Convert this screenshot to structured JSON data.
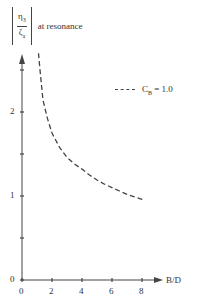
{
  "chart_data": {
    "type": "line",
    "title": "",
    "ylabel": "|η3 / ζa| at resonance",
    "ylabel_parts": {
      "numerator": "η",
      "numerator_sub": "3",
      "denominator": "ζ",
      "denominator_sub": "a",
      "suffix": "at resonance"
    },
    "xlabel": "B/D",
    "xlim": [
      0,
      8.8
    ],
    "ylim": [
      0,
      2.8
    ],
    "x_ticks": [
      0,
      2,
      4,
      6,
      8
    ],
    "x_tick_labels": [
      "0",
      "2",
      "4",
      "6",
      "8"
    ],
    "y_ticks": [
      0,
      0.5,
      1,
      1.5,
      2,
      2.5
    ],
    "y_tick_labels": [
      "0",
      "",
      "1",
      "",
      "2",
      ""
    ],
    "grid": false,
    "legend_position": "upper right",
    "series": [
      {
        "name": "C_B = 1.0",
        "legend_label": "C",
        "legend_sub": "B",
        "legend_value": "= 1.0",
        "style": "dashed",
        "x": [
          1.1,
          1.2,
          1.4,
          1.7,
          2.0,
          2.5,
          3.0,
          3.5,
          4.0,
          4.5,
          5.0,
          5.5,
          6.0,
          6.5,
          7.0,
          7.5,
          8.0,
          8.2
        ],
        "y": [
          2.7,
          2.5,
          2.14,
          1.92,
          1.75,
          1.58,
          1.46,
          1.38,
          1.32,
          1.25,
          1.19,
          1.14,
          1.1,
          1.06,
          1.02,
          0.99,
          0.96,
          0.95
        ]
      }
    ]
  },
  "colors": {
    "axis": "#444444",
    "curve": "#444444",
    "background": "#ffffff"
  }
}
